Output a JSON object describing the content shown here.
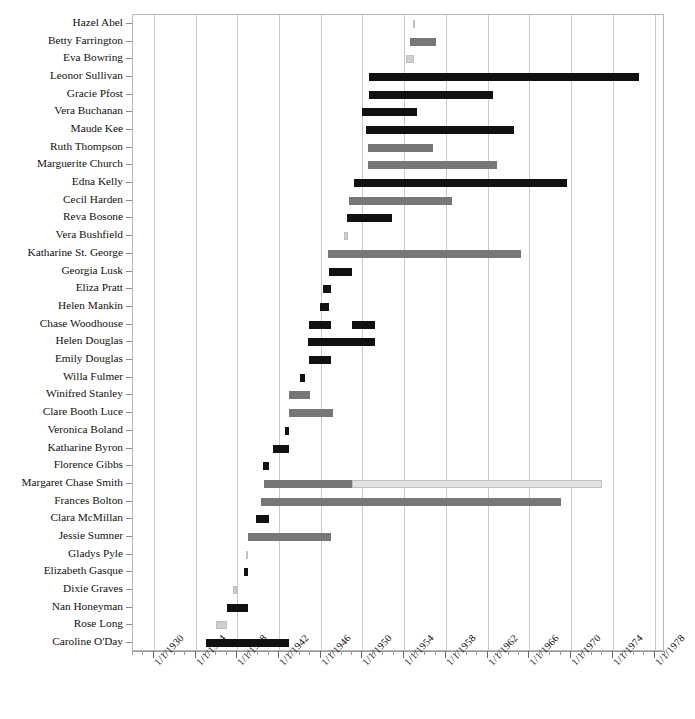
{
  "chart_data": {
    "type": "bar",
    "chart_style": "gantt",
    "title": "",
    "subtitle": "",
    "xlabel": "",
    "ylabel": "",
    "grid": true,
    "legend": false,
    "orientation": "horizontal",
    "x_axis": {
      "type": "date",
      "min": "1/1/1928",
      "max": "1/1/1979",
      "min_year": 1928,
      "max_year": 1979,
      "tick_step_years": 4,
      "minor_tick_step_years": 1,
      "tick_labels": [
        "1/1/1930",
        "1/1/1934",
        "1/1/1938",
        "1/1/1942",
        "1/1/1946",
        "1/1/1950",
        "1/1/1954",
        "1/1/1958",
        "1/1/1962",
        "1/1/1966",
        "1/1/1970",
        "1/1/1974",
        "1/1/1978"
      ],
      "tick_years": [
        1930,
        1934,
        1938,
        1942,
        1946,
        1950,
        1954,
        1958,
        1962,
        1966,
        1970,
        1974,
        1978
      ]
    },
    "colors": {
      "dark": "#111111",
      "medium": "#777777",
      "light": "#cfcfcf",
      "very_light": "#e2e2e2",
      "gridline": "#c9c9c9",
      "frame": "#b9b9b9",
      "background": "#ffffff"
    },
    "categories": [
      "Hazel Abel",
      "Betty Farrington",
      "Eva Bowring",
      "Leonor Sullivan",
      "Gracie Pfost",
      "Vera Buchanan",
      "Maude Kee",
      "Ruth Thompson",
      "Marguerite Church",
      "Edna Kelly",
      "Cecil Harden",
      "Reva Bosone",
      "Vera Bushfield",
      "Katharine St. George",
      "Georgia Lusk",
      "Eliza Pratt",
      "Helen Mankin",
      "Chase Woodhouse",
      "Helen Douglas",
      "Emily Douglas",
      "Willa Fulmer",
      "Winifred Stanley",
      "Clare Booth Luce",
      "Veronica Boland",
      "Katharine Byron",
      "Florence Gibbs",
      "Margaret Chase Smith",
      "Frances Bolton",
      "Clara McMillan",
      "Jessie Sumner",
      "Gladys Pyle",
      "Elizabeth Gasque",
      "Dixie Graves",
      "Nan Honeyman",
      "Rose Long",
      "Caroline O'Day"
    ],
    "bars": [
      {
        "name": "Hazel Abel",
        "segments": [
          {
            "start": 1954.8,
            "end": 1955.0,
            "color": "very_light"
          }
        ]
      },
      {
        "name": "Betty Farrington",
        "segments": [
          {
            "start": 1954.6,
            "end": 1957.0,
            "color": "medium"
          }
        ]
      },
      {
        "name": "Eva Bowring",
        "segments": [
          {
            "start": 1954.2,
            "end": 1954.9,
            "color": "light"
          }
        ]
      },
      {
        "name": "Leonor Sullivan",
        "segments": [
          {
            "start": 1950.6,
            "end": 1976.5,
            "color": "dark"
          }
        ]
      },
      {
        "name": "Gracie Pfost",
        "segments": [
          {
            "start": 1950.6,
            "end": 1962.5,
            "color": "dark"
          }
        ]
      },
      {
        "name": "Vera Buchanan",
        "segments": [
          {
            "start": 1950.0,
            "end": 1955.2,
            "color": "dark"
          }
        ]
      },
      {
        "name": "Maude Kee",
        "segments": [
          {
            "start": 1950.3,
            "end": 1964.5,
            "color": "dark"
          }
        ]
      },
      {
        "name": "Ruth Thompson",
        "segments": [
          {
            "start": 1950.5,
            "end": 1956.8,
            "color": "medium"
          }
        ]
      },
      {
        "name": "Marguerite Church",
        "segments": [
          {
            "start": 1950.5,
            "end": 1962.9,
            "color": "medium"
          }
        ]
      },
      {
        "name": "Edna Kelly",
        "segments": [
          {
            "start": 1949.2,
            "end": 1969.6,
            "color": "dark"
          }
        ]
      },
      {
        "name": "Cecil Harden",
        "segments": [
          {
            "start": 1948.7,
            "end": 1958.6,
            "color": "medium"
          }
        ]
      },
      {
        "name": "Reva Bosone",
        "segments": [
          {
            "start": 1948.5,
            "end": 1952.8,
            "color": "dark"
          }
        ]
      },
      {
        "name": "Vera Bushfield",
        "segments": [
          {
            "start": 1948.2,
            "end": 1948.6,
            "color": "light"
          }
        ]
      },
      {
        "name": "Katharine St. George",
        "segments": [
          {
            "start": 1946.7,
            "end": 1965.2,
            "color": "medium"
          }
        ]
      },
      {
        "name": "Georgia Lusk",
        "segments": [
          {
            "start": 1946.8,
            "end": 1949.0,
            "color": "dark"
          }
        ]
      },
      {
        "name": "Eliza Pratt",
        "segments": [
          {
            "start": 1946.2,
            "end": 1947.0,
            "color": "dark"
          }
        ]
      },
      {
        "name": "Helen Mankin",
        "segments": [
          {
            "start": 1945.9,
            "end": 1946.8,
            "color": "dark"
          }
        ]
      },
      {
        "name": "Chase Woodhouse",
        "segments": [
          {
            "start": 1944.9,
            "end": 1947.0,
            "color": "dark"
          },
          {
            "start": 1949.0,
            "end": 1951.2,
            "color": "dark"
          }
        ]
      },
      {
        "name": "Helen Douglas",
        "segments": [
          {
            "start": 1944.8,
            "end": 1951.2,
            "color": "dark"
          }
        ]
      },
      {
        "name": "Emily Douglas",
        "segments": [
          {
            "start": 1944.9,
            "end": 1947.0,
            "color": "dark"
          }
        ]
      },
      {
        "name": "Willa Fulmer",
        "segments": [
          {
            "start": 1944.0,
            "end": 1944.5,
            "color": "dark"
          }
        ]
      },
      {
        "name": "Winifred Stanley",
        "segments": [
          {
            "start": 1943.0,
            "end": 1945.0,
            "color": "medium"
          }
        ]
      },
      {
        "name": "Clare Booth Luce",
        "segments": [
          {
            "start": 1943.0,
            "end": 1947.2,
            "color": "medium"
          }
        ]
      },
      {
        "name": "Veronica Boland",
        "segments": [
          {
            "start": 1942.6,
            "end": 1943.0,
            "color": "dark"
          }
        ]
      },
      {
        "name": "Katharine Byron",
        "segments": [
          {
            "start": 1941.4,
            "end": 1943.0,
            "color": "dark"
          }
        ]
      },
      {
        "name": "Florence Gibbs",
        "segments": [
          {
            "start": 1940.5,
            "end": 1941.0,
            "color": "dark"
          }
        ]
      },
      {
        "name": "Margaret Chase Smith",
        "segments": [
          {
            "start": 1940.6,
            "end": 1949.0,
            "color": "medium"
          },
          {
            "start": 1949.0,
            "end": 1973.0,
            "color": "very_light"
          }
        ]
      },
      {
        "name": "Frances Bolton",
        "segments": [
          {
            "start": 1940.3,
            "end": 1969.0,
            "color": "medium"
          }
        ]
      },
      {
        "name": "Clara McMillan",
        "segments": [
          {
            "start": 1939.8,
            "end": 1941.0,
            "color": "dark"
          }
        ]
      },
      {
        "name": "Jessie Sumner",
        "segments": [
          {
            "start": 1939.0,
            "end": 1947.0,
            "color": "medium"
          }
        ]
      },
      {
        "name": "Gladys Pyle",
        "segments": [
          {
            "start": 1938.8,
            "end": 1939.0,
            "color": "light"
          }
        ]
      },
      {
        "name": "Elizabeth Gasque",
        "segments": [
          {
            "start": 1938.6,
            "end": 1939.0,
            "color": "dark"
          }
        ]
      },
      {
        "name": "Dixie Graves",
        "segments": [
          {
            "start": 1937.6,
            "end": 1938.0,
            "color": "light"
          }
        ]
      },
      {
        "name": "Nan Honeyman",
        "segments": [
          {
            "start": 1937.0,
            "end": 1939.0,
            "color": "dark"
          }
        ]
      },
      {
        "name": "Rose Long",
        "segments": [
          {
            "start": 1936.0,
            "end": 1937.0,
            "color": "light"
          }
        ]
      },
      {
        "name": "Caroline O'Day",
        "segments": [
          {
            "start": 1935.0,
            "end": 1943.0,
            "color": "dark"
          }
        ]
      }
    ]
  }
}
